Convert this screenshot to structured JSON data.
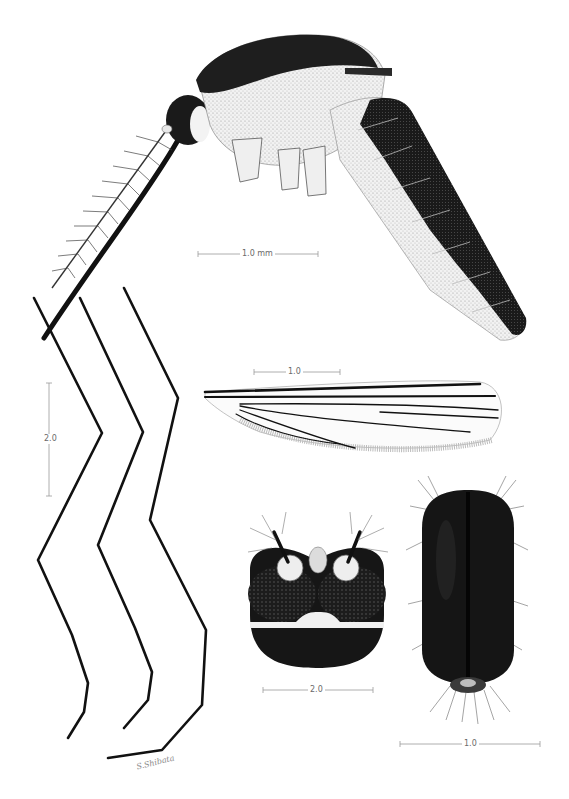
{
  "plate": {
    "subject": "mosquito morphology plate",
    "views": [
      {
        "id": "lateral-habitus",
        "description": "adult, lateral view"
      },
      {
        "id": "wing",
        "description": "wing"
      },
      {
        "id": "legs",
        "description": "fore, mid and hind legs"
      },
      {
        "id": "head-frontal",
        "description": "head, frontal view"
      },
      {
        "id": "thorax-dorsal",
        "description": "scutum, dorsal view"
      }
    ],
    "colors": {
      "ink": "#111111",
      "paper": "#ffffff",
      "scale": "#9a9a9a",
      "label": "#6a6a6a"
    }
  },
  "scale_bars": {
    "habitus": "1.0 mm",
    "wing": "1.0",
    "legs": "2.0",
    "head": "2.0",
    "thorax": "1.0"
  },
  "signature": "S.Shibata"
}
